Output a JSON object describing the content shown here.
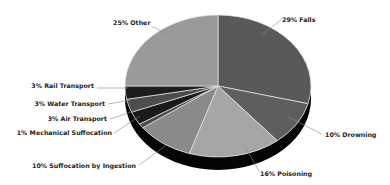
{
  "chart_data": {
    "type": "pie",
    "style": "3d-tilted",
    "title": "",
    "categories": [
      "Falls",
      "Drowning",
      "Poisoning",
      "Suffocation by Ingestion",
      "Mechanical Suffocation",
      "Air Transport",
      "Water Transport",
      "Rail Transport",
      "Other"
    ],
    "values": [
      29,
      10,
      16,
      10,
      1,
      3,
      3,
      3,
      25
    ],
    "unit": "%",
    "colors": [
      "#595959",
      "#5e5e5e",
      "#a6a6a6",
      "#8a8a8a",
      "#4a4a4a",
      "#1a1a1a",
      "#4d4d4d",
      "#1c1c1c",
      "#9a9a9a"
    ],
    "labels": [
      {
        "text": "29% Falls",
        "x": 282,
        "y": 22,
        "anchor": "start",
        "lx1": 282,
        "ly1": 19,
        "lx2": 262,
        "ly2": 35
      },
      {
        "text": "10% Drowning",
        "x": 325,
        "y": 137,
        "anchor": "start",
        "lx1": 322,
        "ly1": 134,
        "lx2": 288,
        "ly2": 117
      },
      {
        "text": "16% Poisoning",
        "x": 260,
        "y": 176,
        "anchor": "start",
        "lx1": 259,
        "ly1": 171,
        "lx2": 243,
        "ly2": 143
      },
      {
        "text": "10% Suffocation by Ingestion",
        "x": 136,
        "y": 168,
        "anchor": "end",
        "lx1": 139,
        "ly1": 165,
        "lx2": 175,
        "ly2": 139
      },
      {
        "text": "1% Mechanical Suffocation",
        "x": 112,
        "y": 135,
        "anchor": "end",
        "lx1": 114,
        "ly1": 133,
        "lx2": 140,
        "ly2": 116
      },
      {
        "text": "3% Air Transport",
        "x": 107,
        "y": 121,
        "anchor": "end",
        "lx1": 110,
        "ly1": 119,
        "lx2": 137,
        "ly2": 110
      },
      {
        "text": "3% Water Transport",
        "x": 105,
        "y": 106,
        "anchor": "end",
        "lx1": 108,
        "ly1": 104,
        "lx2": 131,
        "ly2": 100
      },
      {
        "text": "3% Rail Transport",
        "x": 94,
        "y": 88,
        "anchor": "end",
        "lx1": 97,
        "ly1": 88,
        "lx2": 128,
        "ly2": 88
      },
      {
        "text": "25% Other",
        "x": 113,
        "y": 25,
        "anchor": "start",
        "lx1": 151,
        "ly1": 26,
        "lx2": 172,
        "ly2": 36
      }
    ],
    "geometry": {
      "cx": 218,
      "cy": 86,
      "rx": 93,
      "ry": 71,
      "depth": 13,
      "start_deg": 0
    },
    "legend": "none",
    "grid": false
  }
}
